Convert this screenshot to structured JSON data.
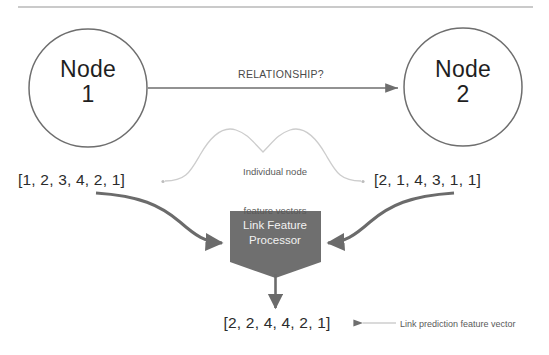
{
  "diagram": {
    "title_rule": "horizontal-rule",
    "nodes": [
      {
        "id": "node-1",
        "label": "Node\n1",
        "line1": "Node",
        "line2": "1"
      },
      {
        "id": "node-2",
        "label": "Node\n2",
        "line1": "Node",
        "line2": "2"
      }
    ],
    "relationship_label": "RELATIONSHIP?",
    "brace_caption_line1": "Individual node",
    "brace_caption_line2": "feature vectors",
    "feature_vectors": {
      "left": "[1, 2, 3, 4, 2, 1]",
      "right": "[2, 1, 4, 3, 1, 1]",
      "output": "[2, 2, 4, 4, 2, 1]"
    },
    "processor": {
      "line1": "Link Feature",
      "line2": "Processor"
    },
    "prediction_caption": "Link prediction feature vector",
    "colors": {
      "node_stroke": "#6e6e6e",
      "arrow_dark": "#6b6b6b",
      "brace_light": "#c9c9c9",
      "processor_fill": "#6f6f6f",
      "processor_text": "#f2f2f2",
      "text": "#2b2b2b",
      "rule": "#b8b8b8"
    }
  }
}
